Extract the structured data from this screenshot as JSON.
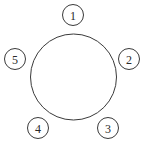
{
  "diagram": {
    "type": "round-table-seating",
    "center_circle": {
      "cx": 73.5,
      "cy": 77,
      "r": 43
    },
    "seats": [
      {
        "label": "1",
        "cx": 73,
        "cy": 15,
        "r": 10.5
      },
      {
        "label": "2",
        "cx": 129,
        "cy": 59,
        "r": 10.5
      },
      {
        "label": "3",
        "cx": 108,
        "cy": 128,
        "r": 10.5
      },
      {
        "label": "4",
        "cx": 38,
        "cy": 128,
        "r": 10.5
      },
      {
        "label": "5",
        "cx": 15,
        "cy": 59,
        "r": 10.5
      }
    ],
    "stroke_color": "#3a3a3a",
    "background": "#ffffff"
  }
}
